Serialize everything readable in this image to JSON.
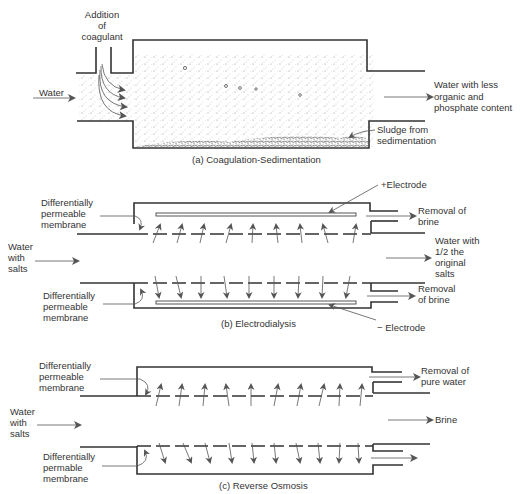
{
  "header_fragment": "",
  "panel_a": {
    "caption": "(a)  Coagulation-Sedimentation",
    "labels": {
      "addition_line1": "Addition",
      "addition_line2": "of",
      "addition_line3": "coagulant",
      "water_in": "Water",
      "out_line1": "Water with less",
      "out_line2": "organic and",
      "out_line3": "phosphate content",
      "sludge_line1": "Sludge from",
      "sludge_line2": "sedimentation"
    }
  },
  "panel_b": {
    "caption": "(b)  Electrodialysis",
    "labels": {
      "electrode_pos": "+Electrode",
      "electrode_neg": "− Electrode",
      "membrane_top_1": "Differentially",
      "membrane_top_2": "permeable",
      "membrane_top_3": "membrane",
      "membrane_bot_1": "Differentially",
      "membrane_bot_2": "permeable",
      "membrane_bot_3": "membrane",
      "water_in_1": "Water",
      "water_in_2": "with",
      "water_in_3": "salts",
      "brine_top_1": "Removal of",
      "brine_top_2": "brine",
      "out_1": "Water with",
      "out_2": "1/2 the",
      "out_3": "original",
      "out_4": "salts",
      "brine_bot_1": "Removal",
      "brine_bot_2": "of brine"
    }
  },
  "panel_c": {
    "caption": "(c)  Reverse Osmosis",
    "labels": {
      "membrane_top_1": "Differentially",
      "membrane_top_2": "permeable",
      "membrane_top_3": "membrane",
      "membrane_bot_1": "Differentially",
      "membrane_bot_2": "permable",
      "membrane_bot_3": "membrane",
      "water_in_1": "Water",
      "water_in_2": "with",
      "water_in_3": "salts",
      "pure_1": "Removal of",
      "pure_2": "pure water",
      "brine": "Brine"
    }
  }
}
